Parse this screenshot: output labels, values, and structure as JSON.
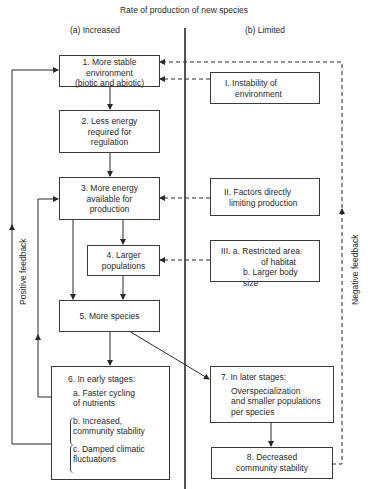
{
  "title": "Rate of production of new species",
  "columns": {
    "left": "(a) Increased",
    "right": "(b) Limited"
  },
  "boxes": {
    "b1": {
      "lines": [
        "1.      More stable",
        "environment",
        "(biotic and abiotic)"
      ]
    },
    "b2": {
      "lines": [
        "2.      Less energy",
        "required for",
        "regulation"
      ]
    },
    "b3": {
      "lines": [
        "3.      More energy",
        "available for",
        "production"
      ]
    },
    "b4": {
      "lines": [
        "4.        Larger",
        "populations"
      ]
    },
    "b5": {
      "lines": [
        "5.      More species"
      ]
    },
    "b6": {
      "heading": "6.      In early stages:",
      "a": "a. Faster cycling",
      "a2": "of nutrients",
      "b": "b. Increased,",
      "b2": "community stability",
      "c": "c. Damped climatic",
      "c2": "fluctuations"
    },
    "b7": {
      "heading": "7.     In later stages:",
      "l1": "Overspecialization",
      "l2": "and smaller populations",
      "l3": "per species"
    },
    "b8": {
      "lines": [
        "8.       Decreased",
        "community stability"
      ]
    },
    "bI": {
      "lines": [
        "I. Instability of",
        "environment"
      ]
    },
    "bII": {
      "lines": [
        "II. Factors directly",
        "limiting production"
      ]
    },
    "bIII": {
      "lines": [
        "III. a. Restricted area",
        "of habitat",
        "b. Larger body size"
      ]
    }
  },
  "feedback": {
    "positive": "Positive feedback",
    "negative": "Negative feedback"
  },
  "colors": {
    "line": "#2a2a2a",
    "background": "#ffffff"
  }
}
